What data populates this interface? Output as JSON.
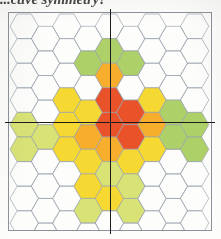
{
  "heading": {
    "text": "...ctive symmetry?"
  },
  "figure": {
    "frame_color": "#8d9199",
    "axis_color": "#1c1c1e",
    "hex_outline_color": "#9aa3ad"
  },
  "legend": {
    "levels": [
      {
        "name": "level-0",
        "label": "none",
        "color": "#ffffff"
      },
      {
        "name": "level-1",
        "label": "green",
        "color": "#a8cc5c"
      },
      {
        "name": "level-2",
        "label": "yellow-green",
        "color": "#d6e06a"
      },
      {
        "name": "level-3",
        "label": "yellow",
        "color": "#f5d524"
      },
      {
        "name": "level-4",
        "label": "orange",
        "color": "#f5a81c"
      },
      {
        "name": "level-5",
        "label": "red",
        "color": "#e8461a"
      }
    ]
  },
  "chart_data": {
    "type": "heatmap",
    "xlabel": "",
    "ylabel": "",
    "grid": "hexagonal-flat-top",
    "columns": 9,
    "rows": 11,
    "legend_position": "none",
    "annotations": [
      {
        "name": "vertical-axis",
        "orientation": "vertical",
        "position": 0.5
      },
      {
        "name": "horizontal-axis",
        "orientation": "horizontal",
        "position": 0.5
      }
    ],
    "palette": [
      "#ffffff",
      "#a8cc5c",
      "#d6e06a",
      "#f5d524",
      "#f5a81c",
      "#e8461a"
    ],
    "value_labels": [
      "0",
      "1",
      "2",
      "3",
      "4",
      "5"
    ],
    "cells": [
      {
        "col": 0,
        "row": 0,
        "v": 0
      },
      {
        "col": 0,
        "row": 1,
        "v": 0
      },
      {
        "col": 0,
        "row": 2,
        "v": 0
      },
      {
        "col": 0,
        "row": 3,
        "v": 0
      },
      {
        "col": 0,
        "row": 4,
        "v": 2
      },
      {
        "col": 0,
        "row": 5,
        "v": 2
      },
      {
        "col": 0,
        "row": 6,
        "v": 0
      },
      {
        "col": 0,
        "row": 7,
        "v": 0
      },
      {
        "col": 0,
        "row": 8,
        "v": 0
      },
      {
        "col": 0,
        "row": 9,
        "v": 0
      },
      {
        "col": 0,
        "row": 10,
        "v": 0
      },
      {
        "col": 1,
        "row": 0,
        "v": 0
      },
      {
        "col": 1,
        "row": 1,
        "v": 0
      },
      {
        "col": 1,
        "row": 2,
        "v": 0
      },
      {
        "col": 1,
        "row": 3,
        "v": 0
      },
      {
        "col": 1,
        "row": 4,
        "v": 2
      },
      {
        "col": 1,
        "row": 5,
        "v": 0
      },
      {
        "col": 1,
        "row": 6,
        "v": 0
      },
      {
        "col": 1,
        "row": 7,
        "v": 0
      },
      {
        "col": 1,
        "row": 8,
        "v": 0
      },
      {
        "col": 1,
        "row": 9,
        "v": 0
      },
      {
        "col": 1,
        "row": 10,
        "v": 0
      },
      {
        "col": 2,
        "row": 0,
        "v": 0
      },
      {
        "col": 2,
        "row": 1,
        "v": 0
      },
      {
        "col": 2,
        "row": 2,
        "v": 0
      },
      {
        "col": 2,
        "row": 3,
        "v": 3
      },
      {
        "col": 2,
        "row": 4,
        "v": 3
      },
      {
        "col": 2,
        "row": 5,
        "v": 3
      },
      {
        "col": 2,
        "row": 6,
        "v": 0
      },
      {
        "col": 2,
        "row": 7,
        "v": 0
      },
      {
        "col": 2,
        "row": 8,
        "v": 0
      },
      {
        "col": 2,
        "row": 9,
        "v": 0
      },
      {
        "col": 2,
        "row": 10,
        "v": 0
      },
      {
        "col": 3,
        "row": 0,
        "v": 0
      },
      {
        "col": 3,
        "row": 1,
        "v": 1
      },
      {
        "col": 3,
        "row": 2,
        "v": 0
      },
      {
        "col": 3,
        "row": 3,
        "v": 3
      },
      {
        "col": 3,
        "row": 4,
        "v": 4
      },
      {
        "col": 3,
        "row": 5,
        "v": 3
      },
      {
        "col": 3,
        "row": 6,
        "v": 3
      },
      {
        "col": 3,
        "row": 7,
        "v": 2
      },
      {
        "col": 3,
        "row": 8,
        "v": 0
      },
      {
        "col": 3,
        "row": 9,
        "v": 0
      },
      {
        "col": 3,
        "row": 10,
        "v": 0
      },
      {
        "col": 4,
        "row": 0,
        "v": 0
      },
      {
        "col": 4,
        "row": 1,
        "v": 1
      },
      {
        "col": 4,
        "row": 2,
        "v": 4
      },
      {
        "col": 4,
        "row": 3,
        "v": 5
      },
      {
        "col": 4,
        "row": 4,
        "v": 5
      },
      {
        "col": 4,
        "row": 5,
        "v": 4
      },
      {
        "col": 4,
        "row": 6,
        "v": 2
      },
      {
        "col": 4,
        "row": 7,
        "v": 3
      },
      {
        "col": 4,
        "row": 8,
        "v": 0
      },
      {
        "col": 4,
        "row": 9,
        "v": 0
      },
      {
        "col": 4,
        "row": 10,
        "v": 0
      },
      {
        "col": 5,
        "row": 0,
        "v": 0
      },
      {
        "col": 5,
        "row": 1,
        "v": 1
      },
      {
        "col": 5,
        "row": 2,
        "v": 0
      },
      {
        "col": 5,
        "row": 3,
        "v": 5
      },
      {
        "col": 5,
        "row": 4,
        "v": 5
      },
      {
        "col": 5,
        "row": 5,
        "v": 3
      },
      {
        "col": 5,
        "row": 6,
        "v": 2
      },
      {
        "col": 5,
        "row": 7,
        "v": 2
      },
      {
        "col": 5,
        "row": 8,
        "v": 0
      },
      {
        "col": 5,
        "row": 9,
        "v": 0
      },
      {
        "col": 5,
        "row": 10,
        "v": 0
      },
      {
        "col": 6,
        "row": 0,
        "v": 0
      },
      {
        "col": 6,
        "row": 1,
        "v": 0
      },
      {
        "col": 6,
        "row": 2,
        "v": 0
      },
      {
        "col": 6,
        "row": 3,
        "v": 3
      },
      {
        "col": 6,
        "row": 4,
        "v": 4
      },
      {
        "col": 6,
        "row": 5,
        "v": 3
      },
      {
        "col": 6,
        "row": 6,
        "v": 0
      },
      {
        "col": 6,
        "row": 7,
        "v": 0
      },
      {
        "col": 6,
        "row": 8,
        "v": 0
      },
      {
        "col": 6,
        "row": 9,
        "v": 0
      },
      {
        "col": 6,
        "row": 10,
        "v": 0
      },
      {
        "col": 7,
        "row": 0,
        "v": 0
      },
      {
        "col": 7,
        "row": 1,
        "v": 0
      },
      {
        "col": 7,
        "row": 2,
        "v": 0
      },
      {
        "col": 7,
        "row": 3,
        "v": 1
      },
      {
        "col": 7,
        "row": 4,
        "v": 1
      },
      {
        "col": 7,
        "row": 5,
        "v": 0
      },
      {
        "col": 7,
        "row": 6,
        "v": 0
      },
      {
        "col": 7,
        "row": 7,
        "v": 0
      },
      {
        "col": 7,
        "row": 8,
        "v": 0
      },
      {
        "col": 7,
        "row": 9,
        "v": 0
      },
      {
        "col": 7,
        "row": 10,
        "v": 0
      },
      {
        "col": 8,
        "row": 0,
        "v": 0
      },
      {
        "col": 8,
        "row": 1,
        "v": 0
      },
      {
        "col": 8,
        "row": 2,
        "v": 0
      },
      {
        "col": 8,
        "row": 3,
        "v": 0
      },
      {
        "col": 8,
        "row": 4,
        "v": 1
      },
      {
        "col": 8,
        "row": 5,
        "v": 1
      },
      {
        "col": 8,
        "row": 6,
        "v": 0
      },
      {
        "col": 8,
        "row": 7,
        "v": 0
      },
      {
        "col": 8,
        "row": 8,
        "v": 0
      },
      {
        "col": 8,
        "row": 9,
        "v": 0
      },
      {
        "col": 8,
        "row": 10,
        "v": 0
      }
    ]
  }
}
